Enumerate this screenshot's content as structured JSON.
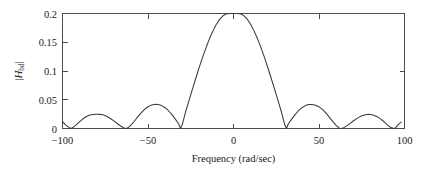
{
  "figure": {
    "background_color": "#ffffff",
    "line_color": "#3a3a3a",
    "axis_color": "#4d4d4d",
    "ylabel_prefix": "|",
    "ylabel_symbol": "H",
    "ylabel_subscript": "bd",
    "ylabel_suffix": "|"
  },
  "chart_data": {
    "type": "line",
    "title": "",
    "xlabel": "Frequency (rad/sec)",
    "ylabel": "|H_bd|",
    "xlim": [
      -100,
      100
    ],
    "ylim": [
      0,
      0.2
    ],
    "xticks": [
      -100,
      -50,
      0,
      50,
      100
    ],
    "xticklabels": [
      "−100",
      "−50",
      "0",
      "50",
      "100"
    ],
    "yticks": [
      0,
      0.05,
      0.1,
      0.15,
      0.2
    ],
    "yticklabels": [
      "0",
      "0.05",
      "0.1",
      "0.15",
      "0.2"
    ],
    "grid": false,
    "legend": false,
    "zero_crossings": [
      -95,
      -63,
      -31,
      31,
      63,
      95
    ],
    "sidelobe_peaks": [
      {
        "x": -79,
        "y": 0.025
      },
      {
        "x": -45,
        "y": 0.042
      },
      {
        "x": 45,
        "y": 0.041
      },
      {
        "x": 79,
        "y": 0.024
      }
    ],
    "mainlobe_peak": {
      "x": 0,
      "y": 0.2
    },
    "endpoint_values": [
      {
        "x": -100,
        "y": 0.012
      },
      {
        "x": 100,
        "y": 0.011
      }
    ],
    "x": [
      -100,
      -98,
      -96,
      -95,
      -94,
      -92,
      -90,
      -88,
      -86,
      -84,
      -82,
      -80,
      -79,
      -78,
      -76,
      -74,
      -72,
      -70,
      -68,
      -66,
      -64,
      -63,
      -62,
      -60,
      -58,
      -56,
      -54,
      -52,
      -50,
      -48,
      -46,
      -45,
      -44,
      -42,
      -40,
      -38,
      -36,
      -34,
      -32,
      -31,
      -30,
      -28,
      -26,
      -24,
      -22,
      -20,
      -18,
      -16,
      -14,
      -12,
      -10,
      -8,
      -6,
      -4,
      -2,
      0,
      2,
      4,
      6,
      8,
      10,
      12,
      14,
      16,
      18,
      20,
      22,
      24,
      26,
      28,
      30,
      31,
      32,
      34,
      36,
      38,
      40,
      42,
      44,
      45,
      46,
      48,
      50,
      52,
      54,
      56,
      58,
      60,
      62,
      63,
      64,
      66,
      68,
      70,
      72,
      74,
      76,
      78,
      79,
      80,
      82,
      84,
      86,
      88,
      90,
      92,
      94,
      95,
      96,
      98,
      100
    ],
    "y": [
      0.012,
      0.006,
      0.0015,
      0.0,
      0.0016,
      0.0063,
      0.0118,
      0.0169,
      0.0209,
      0.0233,
      0.0245,
      0.0249,
      0.0249,
      0.0246,
      0.0233,
      0.0209,
      0.0174,
      0.0132,
      0.0087,
      0.0043,
      0.0008,
      0.0,
      0.0007,
      0.0058,
      0.0126,
      0.0201,
      0.0273,
      0.0334,
      0.0379,
      0.0407,
      0.0419,
      0.042,
      0.0417,
      0.0398,
      0.0362,
      0.0309,
      0.0241,
      0.0163,
      0.0079,
      0.0,
      0.0065,
      0.0291,
      0.0488,
      0.0684,
      0.0878,
      0.1066,
      0.1245,
      0.1412,
      0.1564,
      0.1698,
      0.1812,
      0.1902,
      0.1964,
      0.1994,
      0.2,
      0.2,
      0.2,
      0.1994,
      0.1964,
      0.1902,
      0.1812,
      0.1698,
      0.1564,
      0.1412,
      0.1245,
      0.1066,
      0.0878,
      0.0684,
      0.0488,
      0.0291,
      0.0065,
      0.0,
      0.0079,
      0.0163,
      0.0241,
      0.0309,
      0.0362,
      0.0398,
      0.0417,
      0.0418,
      0.0417,
      0.0405,
      0.0377,
      0.0332,
      0.0271,
      0.0199,
      0.0124,
      0.0056,
      0.0006,
      0.0,
      0.0007,
      0.0042,
      0.0086,
      0.013,
      0.0172,
      0.0207,
      0.0231,
      0.0244,
      0.0246,
      0.0245,
      0.0232,
      0.0206,
      0.0167,
      0.0118,
      0.0063,
      0.0016,
      0.0,
      0.0015,
      0.006,
      0.011
    ]
  }
}
